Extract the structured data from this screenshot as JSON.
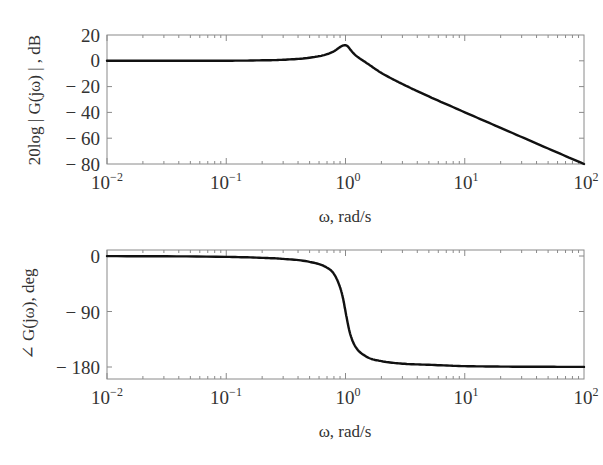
{
  "chart_data": [
    {
      "type": "line",
      "title": "",
      "xlabel": "ω,  rad/s",
      "ylabel": "20log | G(jω) | , dB",
      "xscale": "log",
      "xlim": [
        0.01,
        100
      ],
      "ylim": [
        -80,
        20
      ],
      "grid": false,
      "x_ticks": [
        "10^-2",
        "10^-1",
        "10^0",
        "10^1",
        "10^2"
      ],
      "y_ticks": [
        "20",
        "0",
        "-20",
        "-40",
        "-60",
        "-80"
      ],
      "series": [
        {
          "name": "magnitude",
          "x": [
            0.01,
            0.1,
            0.2,
            0.3,
            0.5,
            0.7,
            0.8,
            0.9,
            0.95,
            1.0,
            1.05,
            1.1,
            1.2,
            1.5,
            2,
            3,
            5,
            10,
            20,
            50,
            100
          ],
          "y": [
            0.0,
            0.08,
            0.35,
            0.8,
            2.4,
            5.1,
            7.4,
            10.6,
            11.8,
            12.0,
            11.0,
            8.6,
            4.7,
            -1.6,
            -9.4,
            -18.0,
            -27.6,
            -39.9,
            -52.0,
            -68.0,
            -80.0
          ]
        }
      ]
    },
    {
      "type": "line",
      "title": "",
      "xlabel": "ω,  rad/s",
      "ylabel": "∠G(jω), deg",
      "xscale": "log",
      "xlim": [
        0.01,
        100
      ],
      "ylim": [
        -200,
        10
      ],
      "grid": false,
      "x_ticks": [
        "10^-2",
        "10^-1",
        "10^0",
        "10^1",
        "10^2"
      ],
      "y_ticks": [
        "0",
        "-90",
        "-180"
      ],
      "series": [
        {
          "name": "phase",
          "x": [
            0.01,
            0.1,
            0.2,
            0.3,
            0.5,
            0.7,
            0.8,
            0.9,
            0.95,
            1.0,
            1.05,
            1.1,
            1.2,
            1.5,
            2,
            3,
            5,
            10,
            20,
            50,
            100
          ],
          "y": [
            -0.14,
            -1.4,
            -3.0,
            -4.7,
            -9.5,
            -18.9,
            -29.1,
            -50.6,
            -67.4,
            -90.0,
            -111.3,
            -127.6,
            -145.7,
            -163.3,
            -170.5,
            -174.6,
            -176.4,
            -178.6,
            -179.3,
            -179.7,
            -179.9
          ]
        }
      ]
    }
  ],
  "plots": {
    "magnitude": {
      "ylabel": "20log | G(jω) | , dB",
      "xlabel": "ω,  rad/s",
      "y_tick_labels": [
        "20",
        "0",
        "− 20",
        "− 40",
        "− 60",
        "− 80"
      ],
      "x_tick_bases": [
        "10",
        "10",
        "10",
        "10",
        "10"
      ],
      "x_tick_exps": [
        "−2",
        "−1",
        "0",
        "1",
        "2"
      ]
    },
    "phase": {
      "ylabel": "∠ G(jω), deg",
      "xlabel": "ω,  rad/s",
      "y_tick_labels": [
        "0",
        "− 90",
        "− 180"
      ],
      "x_tick_bases": [
        "10",
        "10",
        "10",
        "10",
        "10"
      ],
      "x_tick_exps": [
        "−2",
        "−1",
        "0",
        "1",
        "2"
      ]
    }
  }
}
